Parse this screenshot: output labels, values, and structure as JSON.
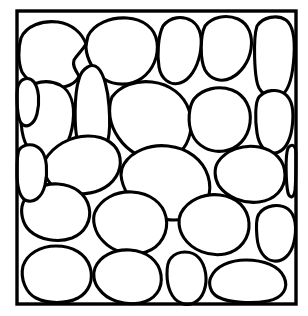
{
  "figure": {
    "background_color": "#ffffff",
    "ink_color": "#000000",
    "grain_fill_color": "#ffffff",
    "canvas": {
      "width": 308,
      "height": 316
    }
  },
  "frame": {
    "name": "specimen-boundary",
    "x": 17,
    "y": 11,
    "width": 279,
    "height": 293,
    "stroke_width": 3.4
  },
  "chart_data": {
    "type": "diagram",
    "grain_count": 24,
    "grains": [
      {
        "id": "grain-01",
        "label": "top-left large grain",
        "centroid": [
          65,
          53
        ],
        "path": "M 21 38 C 26 26, 42 20, 58 22 C 72 24, 82 33, 86 44 C 82 51, 77 55, 74 60 C 72 66, 76 71, 79 76 C 76 84, 66 88, 54 88 C 40 88, 28 82, 22 72 C 18 62, 18 48, 21 38 Z"
      },
      {
        "id": "grain-02",
        "label": "top-center-left grain",
        "centroid": [
          122,
          52
        ],
        "path": "M 88 36 C 94 24, 110 17, 127 18 C 143 19, 155 28, 157 42 C 159 56, 153 70, 142 78 C 131 86, 115 86, 104 79 C 94 72, 87 60, 86 48 C 86 44, 87 40, 88 36 Z"
      },
      {
        "id": "grain-03",
        "label": "top-center-right oval grain",
        "centroid": [
          178,
          52
        ],
        "path": "M 163 26 C 170 17, 182 15, 192 21 C 201 27, 203 40, 200 54 C 197 68, 190 80, 180 83 C 170 86, 161 79, 159 67 C 157 55, 158 36, 163 26 Z"
      },
      {
        "id": "grain-04",
        "label": "top-right grain",
        "centroid": [
          222,
          48
        ],
        "path": "M 205 26 C 212 17, 226 14, 238 19 C 249 24, 253 36, 251 49 C 249 62, 241 73, 231 78 C 221 83, 210 79, 205 70 C 200 60, 200 36, 205 26 Z"
      },
      {
        "id": "grain-05",
        "label": "right edge elongated grain",
        "centroid": [
          272,
          60
        ],
        "path": "M 257 26 C 263 17, 277 14, 286 20 C 294 26, 295 40, 294 56 C 293 72, 290 88, 283 94 C 276 100, 264 97, 259 88 C 254 78, 253 38, 257 26 Z"
      },
      {
        "id": "grain-06",
        "label": "upper-left elongated grain",
        "centroid": [
          48,
          118
        ],
        "path": "M 24 92 C 32 81, 48 79, 60 85 C 71 91, 75 105, 73 122 C 71 139, 64 153, 53 157 C 42 161, 30 154, 25 142 C 20 130, 19 102, 24 92 Z"
      },
      {
        "id": "grain-07",
        "label": "tall narrow wedge grain",
        "centroid": [
          89,
          113
        ],
        "path": "M 79 79 C 82 68, 92 62, 98 68 C 104 74, 108 90, 109 106 C 110 120, 110 132, 108 140 C 99 145, 85 146, 78 142 C 74 130, 74 94, 79 79 Z"
      },
      {
        "id": "grain-08",
        "label": "center-upper large grain",
        "centroid": [
          152,
          121
        ],
        "path": "M 112 97 C 120 86, 136 80, 152 82 C 170 84, 184 95, 189 110 C 194 125, 190 143, 180 152 C 168 162, 150 162, 136 154 C 122 146, 112 131, 110 117 C 109 109, 110 102, 112 97 Z"
      },
      {
        "id": "grain-09",
        "label": "center-right round grain",
        "centroid": [
          215,
          116
        ],
        "path": "M 194 99 C 202 89, 218 85, 232 90 C 245 95, 252 108, 250 123 C 248 138, 238 149, 224 151 C 210 153, 197 146, 192 134 C 187 122, 189 106, 194 99 Z"
      },
      {
        "id": "grain-10",
        "label": "right mid elongated grain",
        "centroid": [
          274,
          115
        ],
        "path": "M 259 97 C 265 90, 277 88, 285 94 C 293 100, 294 114, 292 128 C 290 142, 284 152, 275 153 C 266 154, 259 146, 257 133 C 255 120, 255 102, 259 97 Z"
      },
      {
        "id": "grain-11",
        "label": "left mid rounded grain",
        "centroid": [
          82,
          166
        ],
        "path": "M 45 160 C 53 146, 70 136, 88 136 C 106 136, 118 145, 120 158 C 122 171, 114 184, 100 190 C 86 196, 68 195, 56 188 C 46 182, 42 170, 45 160 Z"
      },
      {
        "id": "grain-12",
        "label": "center large grain",
        "centroid": [
          160,
          182
        ],
        "path": "M 124 164 C 132 151, 150 144, 168 146 C 188 148, 203 160, 208 176 C 213 192, 207 208, 194 215 C 180 223, 160 221, 145 212 C 131 203, 122 188, 121 175 C 121 171, 122 167, 124 164 Z"
      },
      {
        "id": "grain-13",
        "label": "right mid-lower grain",
        "centroid": [
          248,
          170
        ],
        "path": "M 218 162 C 226 150, 243 144, 259 147 C 275 150, 285 161, 285 175 C 285 189, 275 200, 259 202 C 243 204, 227 197, 219 186 C 214 178, 214 168, 218 162 Z"
      },
      {
        "id": "grain-14",
        "label": "left lower-mid grain",
        "centroid": [
          55,
          215
        ],
        "path": "M 23 203 C 28 191, 42 183, 58 184 C 74 185, 86 194, 89 207 C 92 220, 85 233, 72 238 C 58 243, 40 240, 30 231 C 22 224, 20 211, 23 203 Z"
      },
      {
        "id": "grain-15",
        "label": "center-lower round grain",
        "centroid": [
          128,
          222
        ],
        "path": "M 95 212 C 101 199, 116 191, 132 192 C 150 193, 163 203, 166 217 C 169 232, 161 247, 146 252 C 131 257, 113 252, 103 241 C 94 232, 92 219, 95 212 Z"
      },
      {
        "id": "grain-16",
        "label": "right-lower round grain",
        "centroid": [
          212,
          222
        ],
        "path": "M 181 213 C 188 200, 204 193, 220 195 C 237 197, 248 208, 249 223 C 250 238, 240 251, 225 254 C 209 257, 192 250, 184 238 C 178 229, 178 219, 181 213 Z"
      },
      {
        "id": "grain-17",
        "label": "right edge lower grain",
        "centroid": [
          275,
          228
        ],
        "path": "M 259 214 C 265 205, 279 203, 288 209 C 296 215, 297 229, 294 242 C 291 255, 283 262, 274 261 C 264 260, 258 250, 257 237 C 256 226, 256 218, 259 214 Z"
      },
      {
        "id": "grain-18",
        "label": "bottom-left grain",
        "centroid": [
          57,
          273
        ],
        "path": "M 23 266 C 27 254, 40 246, 56 246 C 73 246, 86 254, 90 267 C 94 280, 89 292, 78 298 C 66 304, 48 304, 36 298 C 26 293, 20 279, 23 266 Z"
      },
      {
        "id": "grain-19",
        "label": "bottom-center grain",
        "centroid": [
          126,
          277
        ],
        "path": "M 95 268 C 100 256, 114 249, 130 250 C 147 251, 159 261, 161 275 C 163 289, 155 300, 140 303 C 124 306, 107 300, 99 289 C 93 282, 93 273, 95 268 Z"
      },
      {
        "id": "grain-20",
        "label": "bottom-center-right oval grain",
        "centroid": [
          187,
          275
        ],
        "path": "M 171 258 C 178 250, 192 250, 199 258 C 206 266, 208 280, 204 291 C 200 302, 190 307, 181 303 C 171 299, 167 286, 167 274 C 167 267, 168 261, 171 258 Z"
      },
      {
        "id": "grain-21",
        "label": "bottom-right wide grain",
        "centroid": [
          248,
          281
        ],
        "path": "M 211 277 C 216 266, 230 260, 246 260 C 264 260, 279 266, 284 277 C 289 288, 283 298, 268 301 C 252 304, 230 303, 218 297 C 210 293, 208 283, 211 277 Z"
      },
      {
        "id": "grain-22",
        "label": "left edge mid-small grain",
        "centroid": [
          33,
          173
        ],
        "path": "M 19 150 C 24 143, 35 143, 41 150 C 47 157, 48 172, 45 185 C 42 198, 33 204, 25 200 C 19 196, 17 185, 17 172 C 17 162, 17 154, 19 150 Z"
      },
      {
        "id": "grain-23",
        "label": "upper-left corner sliver grain",
        "centroid": [
          29,
          96
        ],
        "path": "M 18 86 C 21 78, 29 76, 34 82 C 39 89, 40 102, 37 114 C 34 125, 26 129, 21 123 C 17 117, 16 94, 18 86 Z"
      },
      {
        "id": "grain-24",
        "label": "top-right corner sliver grain",
        "centroid": [
          292,
          160
        ],
        "path": "M 288 148 C 292 143, 296 145, 296 154 C 296 166, 296 180, 295 190 C 294 198, 290 199, 288 193 C 286 184, 285 156, 288 148 Z"
      }
    ]
  }
}
